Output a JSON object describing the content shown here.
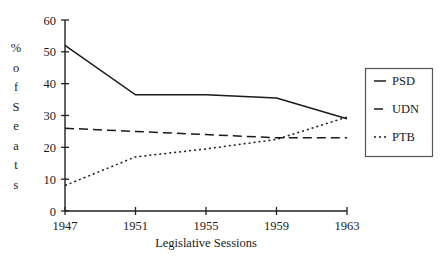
{
  "chart_data": {
    "type": "line",
    "title": "",
    "xlabel": "Legislative Sessions",
    "ylabel": "% of Seats",
    "x": [
      1947,
      1951,
      1955,
      1959,
      1963
    ],
    "categories": [
      "1947",
      "1951",
      "1955",
      "1959",
      "1963"
    ],
    "xlim": [
      1947,
      1963
    ],
    "ylim": [
      0,
      60
    ],
    "yticks": [
      0,
      10,
      20,
      30,
      40,
      50,
      60
    ],
    "ytick_labels": [
      "0",
      "10",
      "20",
      "30",
      "40",
      "50",
      "60"
    ],
    "xticks": [
      1947,
      1951,
      1955,
      1959,
      1963
    ],
    "xtick_labels": [
      "1947",
      "1951",
      "1955",
      "1959",
      "1963"
    ],
    "grid": false,
    "legend_position": "right",
    "series": [
      {
        "name": "PSD",
        "style": "solid",
        "values": [
          52,
          36.5,
          36.5,
          35.5,
          29
        ]
      },
      {
        "name": "UDN",
        "style": "dashed",
        "values": [
          26,
          25,
          24,
          23,
          23
        ]
      },
      {
        "name": "PTB",
        "style": "dotted",
        "values": [
          8,
          17,
          19.5,
          22.5,
          29.5
        ]
      }
    ]
  },
  "axes": {
    "ylabel_chars": [
      "%",
      "o",
      "f",
      "S",
      "e",
      "a",
      "t",
      "s"
    ]
  },
  "legend": {
    "entries": [
      {
        "label": "PSD",
        "style": "solid"
      },
      {
        "label": "UDN",
        "style": "dashed"
      },
      {
        "label": "PTB",
        "style": "dotted"
      }
    ]
  }
}
